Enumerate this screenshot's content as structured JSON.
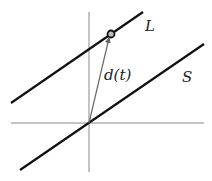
{
  "diagram": {
    "labels": {
      "line_L": "L",
      "line_S": "S",
      "vector": "d(t)"
    },
    "colors": {
      "lines": "#111111",
      "axes": "#777777",
      "vector": "#666666",
      "background": "#ffffff"
    },
    "elements": {
      "x_axis": {
        "x1": 11,
        "y1": 123,
        "x2": 204,
        "y2": 123
      },
      "y_axis": {
        "x1": 89,
        "y1": 12,
        "x2": 89,
        "y2": 172
      },
      "line_S": {
        "x1": 20,
        "y1": 170,
        "x2": 204,
        "y2": 44
      },
      "line_L": {
        "x1": 11,
        "y1": 103,
        "x2": 143,
        "y2": 12
      },
      "point": {
        "cx": 111,
        "cy": 34,
        "r": 3.5
      },
      "vector_from": {
        "x": 89,
        "y": 123
      },
      "vector_to": {
        "x": 109,
        "y": 38
      }
    }
  }
}
